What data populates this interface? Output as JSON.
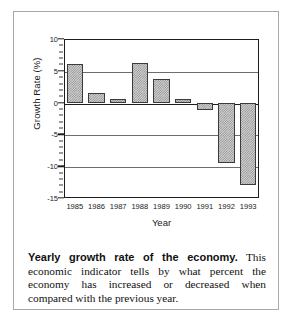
{
  "figure": {
    "caption_lead": "Yearly growth rate of the economy.",
    "caption_body": " This economic indicator tells by what percent the economy has increased or decreased when compared with the previous year."
  },
  "chart_data": {
    "type": "bar",
    "title": "",
    "xlabel": "Year",
    "ylabel": "Growth Rate (%)",
    "categories": [
      "1985",
      "1986",
      "1987",
      "1988",
      "1989",
      "1990",
      "1991",
      "1992",
      "1993"
    ],
    "values": [
      6.0,
      1.5,
      0.5,
      6.2,
      3.7,
      0.5,
      -1.2,
      -9.5,
      -13.0
    ],
    "ylim": [
      -15,
      10
    ],
    "yticks": [
      10,
      5,
      0,
      -5,
      -10,
      -15
    ],
    "ytick_labels": [
      "10",
      "5",
      "0",
      "-5",
      "-10",
      "-15"
    ],
    "minor_tick_step": 1,
    "grid": "horizontal",
    "legend": "none",
    "bar_fill": "stipple-hatch",
    "colors": {
      "bar_fill": "#d2d2d2",
      "bar_pattern": "#8f8f8f",
      "bar_edge": "#3b3b3b",
      "axis": "#1d1d1d",
      "gridline": "#6d6d6d",
      "frame": "#a8a8a8",
      "text": "#1a1a1a",
      "background": "#ffffff"
    }
  }
}
